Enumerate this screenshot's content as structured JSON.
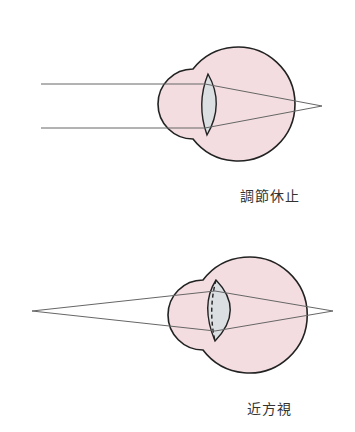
{
  "diagrams": [
    {
      "label": "調節休止",
      "state": "accommodation-at-rest",
      "rays": "parallel"
    },
    {
      "label": "近方視",
      "state": "near-vision",
      "rays": "diverging-from-near-point"
    }
  ],
  "colors": {
    "eyeball_fill": "#f3dde0",
    "lens_fill": "#dcdfe2",
    "outline": "#222222",
    "ray": "#666666"
  }
}
